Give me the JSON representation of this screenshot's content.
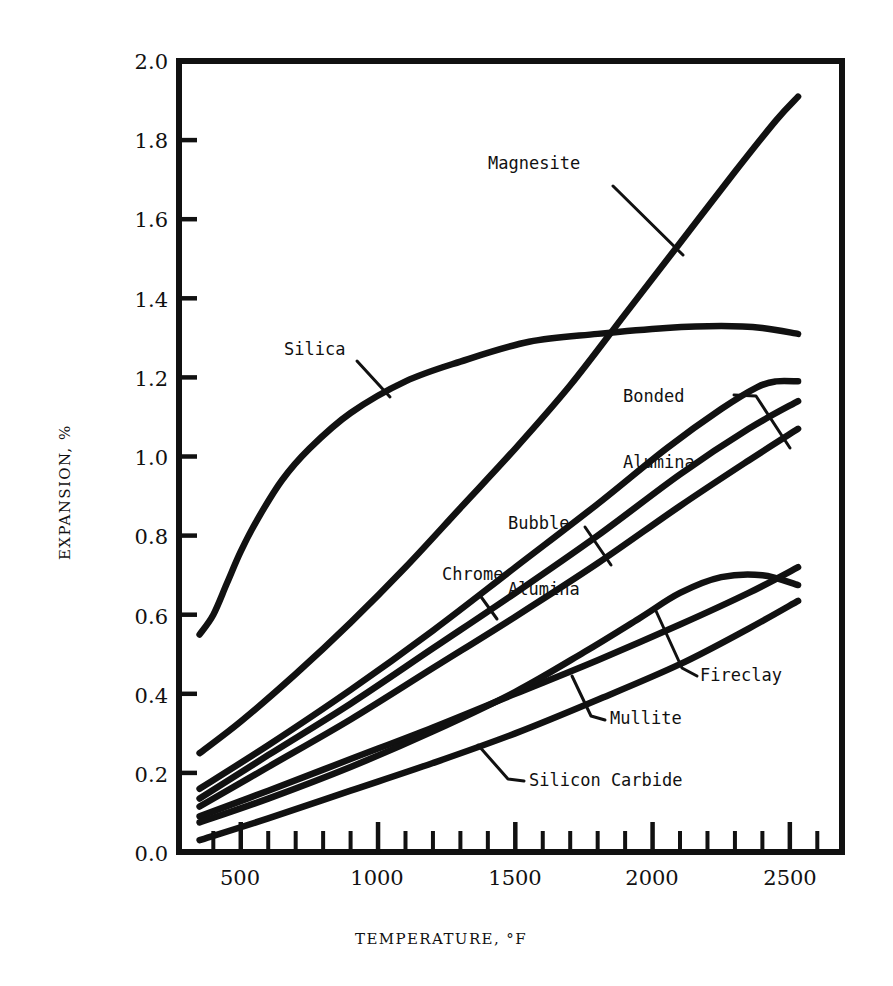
{
  "chart_data": {
    "type": "line",
    "title": "",
    "xlabel": "TEMPERATURE, °F",
    "ylabel": "EXPANSION, %",
    "xlim": [
      275,
      2690
    ],
    "ylim": [
      0.0,
      2.0
    ],
    "grid": false,
    "legend_position": "inline-labels",
    "x_ticks_major": [
      500,
      1000,
      1500,
      2000,
      2500
    ],
    "x_tick_labels": [
      "500",
      "1000",
      "1500",
      "2000",
      "2500"
    ],
    "x_minor_tick_interval": 100,
    "y_ticks": [
      0.0,
      0.2,
      0.4,
      0.6,
      0.8,
      1.0,
      1.2,
      1.4,
      1.6,
      1.8,
      2.0
    ],
    "y_tick_labels": [
      "0.0",
      "0.2",
      "0.4",
      "0.6",
      "0.8",
      "1.0",
      "1.2",
      "1.4",
      "1.6",
      "1.8",
      "2.0"
    ],
    "series": [
      {
        "name": "Magnesite",
        "label": "Magnesite",
        "color": "#111111",
        "x": [
          350,
          500,
          700,
          900,
          1100,
          1300,
          1500,
          1700,
          1900,
          2100,
          2300,
          2450,
          2530
        ],
        "y": [
          0.25,
          0.33,
          0.45,
          0.58,
          0.72,
          0.87,
          1.02,
          1.18,
          1.36,
          1.54,
          1.72,
          1.85,
          1.91
        ]
      },
      {
        "name": "Silica",
        "label": "Silica",
        "color": "#111111",
        "x": [
          350,
          400,
          450,
          500,
          560,
          650,
          750,
          900,
          1100,
          1300,
          1550,
          1800,
          2050,
          2250,
          2400,
          2530
        ],
        "y": [
          0.55,
          0.6,
          0.68,
          0.76,
          0.84,
          0.94,
          1.02,
          1.11,
          1.19,
          1.24,
          1.29,
          1.31,
          1.325,
          1.33,
          1.325,
          1.31
        ]
      },
      {
        "name": "Bonded Alumina",
        "label": "Bonded\nAlumina",
        "color": "#111111",
        "x": [
          350,
          600,
          900,
          1200,
          1500,
          1800,
          2050,
          2250,
          2380,
          2450,
          2530
        ],
        "y": [
          0.16,
          0.27,
          0.41,
          0.56,
          0.72,
          0.88,
          1.02,
          1.12,
          1.175,
          1.19,
          1.19
        ]
      },
      {
        "name": "Bubble Alumina",
        "label": "Bubble\nAlumina",
        "color": "#111111",
        "x": [
          350,
          600,
          900,
          1200,
          1500,
          1800,
          2100,
          2350,
          2530
        ],
        "y": [
          0.135,
          0.245,
          0.375,
          0.515,
          0.655,
          0.8,
          0.955,
          1.07,
          1.14
        ]
      },
      {
        "name": "Chrome",
        "label": "Chrome",
        "color": "#111111",
        "x": [
          350,
          600,
          900,
          1200,
          1500,
          1800,
          2100,
          2350,
          2530
        ],
        "y": [
          0.115,
          0.215,
          0.335,
          0.465,
          0.595,
          0.73,
          0.875,
          0.99,
          1.07
        ]
      },
      {
        "name": "Mullite",
        "label": "Mullite",
        "color": "#111111",
        "x": [
          350,
          600,
          900,
          1200,
          1500,
          1800,
          2100,
          2350,
          2530
        ],
        "y": [
          0.09,
          0.155,
          0.235,
          0.315,
          0.4,
          0.485,
          0.575,
          0.655,
          0.72
        ]
      },
      {
        "name": "Fireclay",
        "label": "Fireclay",
        "color": "#111111",
        "x": [
          350,
          600,
          900,
          1200,
          1500,
          1750,
          1950,
          2100,
          2250,
          2400,
          2530
        ],
        "y": [
          0.075,
          0.135,
          0.215,
          0.305,
          0.405,
          0.505,
          0.59,
          0.655,
          0.695,
          0.7,
          0.675
        ]
      },
      {
        "name": "Silicon Carbide",
        "label": "Silicon Carbide",
        "color": "#111111",
        "x": [
          350,
          600,
          900,
          1200,
          1500,
          1800,
          2100,
          2350,
          2530
        ],
        "y": [
          0.03,
          0.085,
          0.155,
          0.225,
          0.3,
          0.385,
          0.475,
          0.565,
          0.635
        ]
      }
    ],
    "annotations": [
      {
        "name": "magnesite-label",
        "text": "Magnesite",
        "lines": [
          "Magnesite"
        ]
      },
      {
        "name": "silica-label",
        "text": "Silica",
        "lines": [
          "Silica"
        ]
      },
      {
        "name": "bonded-alumina-label",
        "text": "Bonded Alumina",
        "lines": [
          "Bonded",
          "Alumina"
        ]
      },
      {
        "name": "bubble-alumina-label",
        "text": "Bubble Alumina",
        "lines": [
          "Bubble",
          "Alumina"
        ]
      },
      {
        "name": "chrome-label",
        "text": "Chrome",
        "lines": [
          "Chrome"
        ]
      },
      {
        "name": "fireclay-label",
        "text": "Fireclay",
        "lines": [
          "Fireclay"
        ]
      },
      {
        "name": "mullite-label",
        "text": "Mullite",
        "lines": [
          "Mullite"
        ]
      },
      {
        "name": "silicon-carbide-label",
        "text": "Silicon Carbide",
        "lines": [
          "Silicon Carbide"
        ]
      }
    ]
  },
  "axes": {
    "y_title": "EXPANSION, %",
    "x_title": "TEMPERATURE, °F",
    "y_labels": {
      "t0": "2.0",
      "t1": "1.8",
      "t2": "1.6",
      "t3": "1.4",
      "t4": "1.2",
      "t5": "1.0",
      "t6": "0.8",
      "t7": "0.6",
      "t8": "0.4",
      "t9": "0.2",
      "t10": "0.0"
    },
    "x_labels": {
      "t0": "500",
      "t1": "1000",
      "t2": "1500",
      "t3": "2000",
      "t4": "2500"
    }
  },
  "labels": {
    "magnesite": "Magnesite",
    "silica": "Silica",
    "bonded_alumina_1": "Bonded",
    "bonded_alumina_2": "Alumina",
    "bubble_alumina_1": "Bubble",
    "bubble_alumina_2": "Alumina",
    "chrome": "Chrome",
    "fireclay": "Fireclay",
    "mullite": "Mullite",
    "silicon_carbide": "Silicon Carbide"
  },
  "style": {
    "ink": "#111111",
    "paper": "#ffffff"
  }
}
